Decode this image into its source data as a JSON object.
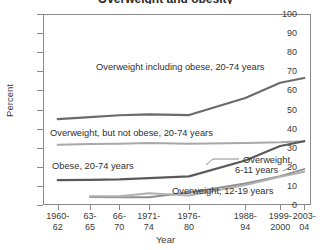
{
  "chart_data": {
    "type": "line",
    "title": "Overweight and obesity",
    "xlabel": "Year",
    "ylabel": "Percent",
    "ylim": [
      0,
      100
    ],
    "ytick_step": 10,
    "yticks": [
      0,
      10,
      20,
      30,
      40,
      50,
      60,
      70,
      80,
      90,
      100
    ],
    "grid": false,
    "legend": "inline annotations with leader lines",
    "categories": [
      "1960-62",
      "63-65",
      "66-70",
      "1971-74",
      "1976-80",
      "1988-94",
      "1999-2000",
      "2003-04"
    ],
    "categories_lines": [
      [
        "1960-",
        "62"
      ],
      [
        "63-",
        "65"
      ],
      [
        "66-",
        "70"
      ],
      [
        "1971-",
        "74"
      ],
      [
        "1976-",
        "80"
      ],
      [
        "1988-",
        "94"
      ],
      [
        "1999-",
        "2000"
      ],
      [
        "2003-",
        "04"
      ]
    ],
    "category_positions": [
      0.055,
      0.175,
      0.285,
      0.395,
      0.545,
      0.755,
      0.885,
      0.975
    ],
    "series": [
      {
        "name": "Overweight including obese, 20-74 years",
        "color": "#6b6b6b",
        "width": 2.2,
        "values": [
          45.0,
          46.0,
          47.0,
          47.4,
          47.1,
          56.0,
          64.0,
          66.5
        ],
        "defined": [
          true,
          true,
          true,
          true,
          true,
          true,
          true,
          true
        ]
      },
      {
        "name": "Overweight, but not obese, 20-74 years",
        "color": "#a8a8a8",
        "width": 2.0,
        "values": [
          31.6,
          31.9,
          32.1,
          32.4,
          32.1,
          32.4,
          32.8,
          33.4
        ],
        "defined": [
          true,
          true,
          true,
          true,
          true,
          true,
          true,
          true
        ]
      },
      {
        "name": "Obese, 20-74 years",
        "color": "#5a5a5a",
        "width": 2.2,
        "values": [
          13.0,
          13.2,
          13.4,
          14.1,
          15.0,
          23.3,
          30.9,
          33.4
        ],
        "defined": [
          true,
          true,
          true,
          true,
          true,
          true,
          true,
          true
        ]
      },
      {
        "name": "Overweight, 6-11 years",
        "color": "#8f8f8f",
        "width": 2.0,
        "values": [
          null,
          4.2,
          4.0,
          4.0,
          6.5,
          11.3,
          15.1,
          18.8
        ],
        "defined": [
          false,
          true,
          true,
          true,
          true,
          true,
          true,
          true
        ]
      },
      {
        "name": "Overweight, 12-19 years",
        "color": "#b0b0b0",
        "width": 2.0,
        "values": [
          null,
          4.6,
          4.6,
          6.1,
          5.0,
          10.5,
          14.8,
          17.4
        ],
        "defined": [
          false,
          true,
          true,
          true,
          true,
          true,
          true,
          true
        ]
      }
    ],
    "annotations": [
      {
        "id": "annot-overweight-including-obese",
        "text": "Overweight including obese, 20-74 years"
      },
      {
        "id": "annot-overweight-not-obese",
        "text": "Overweight, but not obese, 20-74 years"
      },
      {
        "id": "annot-obese",
        "text": "Obese, 20-74 years"
      },
      {
        "id": "annot-overweight-6-11-line1",
        "text": "Overweight,"
      },
      {
        "id": "annot-overweight-6-11-line2",
        "text": "6-11 years"
      },
      {
        "id": "annot-overweight-12-19",
        "text": "Overweight, 12-19 years"
      }
    ]
  }
}
